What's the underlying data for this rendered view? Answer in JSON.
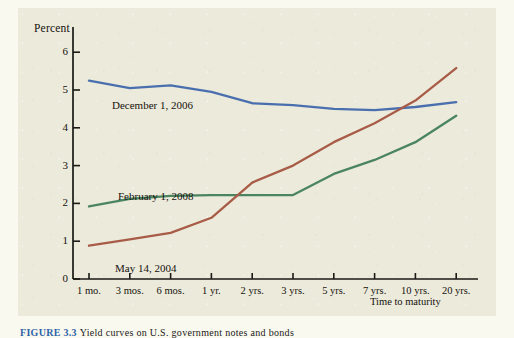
{
  "figure": {
    "caption_number": "FIGURE 3.3",
    "caption_text": "Yield curves on U.S. government notes and bonds"
  },
  "chart_data": {
    "type": "line",
    "title": "",
    "xlabel": "Time to maturity",
    "ylabel": "Percent",
    "ylim": [
      0,
      6
    ],
    "yticks": [
      0,
      1,
      2,
      3,
      4,
      5,
      6
    ],
    "ytick_labels": [
      "0",
      "1",
      "2",
      "3",
      "4",
      "5",
      "6"
    ],
    "grid": false,
    "legend_position": "inline-annotations",
    "categories": [
      "1 mo.",
      "3 mos.",
      "6 mos.",
      "1 yr.",
      "2 yrs.",
      "3 yrs.",
      "5 yrs.",
      "7 yrs.",
      "10 yrs.",
      "20 yrs."
    ],
    "series": [
      {
        "name": "December 1, 2006",
        "color": "#4a6fae",
        "values": [
          5.25,
          5.05,
          5.12,
          4.95,
          4.65,
          4.6,
          4.5,
          4.47,
          4.55,
          4.68
        ]
      },
      {
        "name": "February 1, 2008",
        "color": "#4a8560",
        "values": [
          1.92,
          2.12,
          2.2,
          2.22,
          2.22,
          2.22,
          2.78,
          3.15,
          3.62,
          4.32
        ]
      },
      {
        "name": "May 14, 2004",
        "color": "#a85c47",
        "values": [
          0.88,
          1.05,
          1.22,
          1.62,
          2.55,
          3.0,
          3.62,
          4.12,
          4.72,
          5.58
        ]
      }
    ],
    "annotations": [
      {
        "text": "December 1, 2006",
        "x_px": 112,
        "y_px": 99
      },
      {
        "text": "February 1, 2008",
        "x_px": 118,
        "y_px": 190
      },
      {
        "text": "May 14, 2004",
        "x_px": 115,
        "y_px": 262
      }
    ]
  },
  "axes_geometry": {
    "x0_px": 89,
    "x_step_px": 40.8,
    "y0_px": 279,
    "y_unit_px": 37.8,
    "axis_x_px": 73,
    "axis_top_px": 27,
    "axis_right_px": 478
  }
}
